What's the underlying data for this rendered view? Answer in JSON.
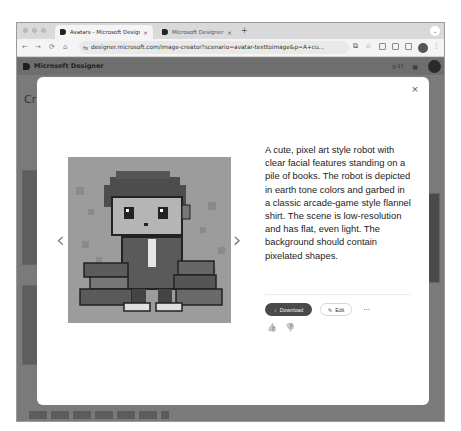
{
  "browser": {
    "tabs": [
      {
        "title": "Avatars - Microsoft Designer",
        "active": true
      },
      {
        "title": "Microsoft Designer - Stunn",
        "active": false
      }
    ],
    "new_tab_label": "+",
    "tab_menu_label": "⌄",
    "close_tab_label": "×",
    "address": "designer.microsoft.com/image-creator?scenario=avatar-texttoimage&p=A+cu...",
    "nav": {
      "back": "←",
      "forward": "→",
      "reload": "⟳",
      "home": "⌂"
    },
    "kebab_label": "⋮"
  },
  "app": {
    "brand": "Microsoft Designer",
    "credits": "◎ 15",
    "page_title_fragment": "Cr"
  },
  "modal": {
    "close_label": "×",
    "description": "A cute, pixel art style robot with clear facial features standing on a pile of books. The robot is depicted in earth tone colors and garbed in a classic arcade-game style flannel shirt. The scene is low-resolution and has flat, even light. The background should contain pixelated shapes.",
    "image_alt": "Pixel art robot standing on a pile of books",
    "prev_label": "‹",
    "next_label": "›",
    "actions": {
      "download": "Download",
      "download_icon": "↓",
      "edit": "Edit",
      "edit_icon": "✎",
      "more": "···"
    },
    "feedback": {
      "like": "👍",
      "dislike": "👎"
    }
  },
  "colors": {
    "overlay": "#7a7a7a",
    "modal_bg": "#ffffff",
    "download_bg": "#4a4a4a",
    "text": "#1c1c1c"
  }
}
